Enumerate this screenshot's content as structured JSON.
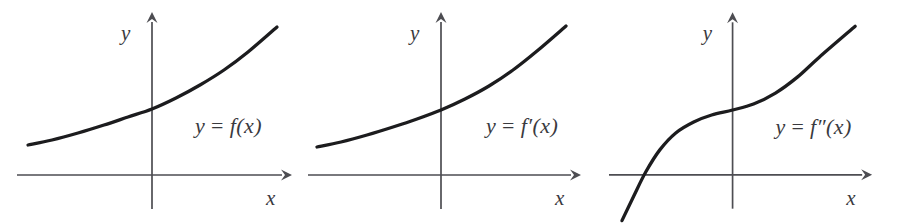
{
  "figure": {
    "background_color": "#ffffff",
    "axis_color": "#4d4d52",
    "curve_color": "#1c1c1e",
    "label_color": "#3a3a3e"
  },
  "panels": [
    {
      "id": "panel-1",
      "curve_label": "y = f(x)",
      "x_axis_label": "x",
      "y_axis_label": "y",
      "curve_description": "increasing convex exponential-like curve entirely above the x-axis"
    },
    {
      "id": "panel-2",
      "curve_label": "y = f′(x)",
      "x_axis_label": "x",
      "y_axis_label": "y",
      "curve_description": "increasing convex exponential-like curve entirely above the x-axis"
    },
    {
      "id": "panel-3",
      "curve_label": "y = f″(x)",
      "x_axis_label": "x",
      "y_axis_label": "y",
      "curve_description": "increasing cubic-like S curve with inflection at the origin, crossing the x-axis on the left"
    }
  ],
  "chart_data": [
    {
      "type": "line",
      "title": "y = f(x)",
      "xlabel": "x",
      "ylabel": "y",
      "grid": false,
      "legend": "none",
      "axes_origin_px": [
        152,
        175
      ],
      "xlim": [
        -2.7,
        2.9
      ],
      "ylim": [
        -0.45,
        3.6
      ],
      "series": [
        {
          "name": "f",
          "points_px": [
            [
              28,
              145
            ],
            [
              52,
              140
            ],
            [
              78,
              133
            ],
            [
              104,
              125
            ],
            [
              128,
              117
            ],
            [
              152,
              109
            ],
            [
              176,
              98
            ],
            [
              200,
              85
            ],
            [
              224,
              70
            ],
            [
              248,
              52
            ],
            [
              277,
              27
            ]
          ],
          "x": [
            -2.7,
            -2.16,
            -1.6,
            -1.04,
            -0.52,
            0,
            0.52,
            1.04,
            1.56,
            2.08,
            2.7
          ],
          "y": [
            0.65,
            0.75,
            0.9,
            1.08,
            1.26,
            1.43,
            1.67,
            1.96,
            2.29,
            2.7,
            3.25
          ]
        }
      ]
    },
    {
      "type": "line",
      "title": "y = f′(x)",
      "xlabel": "x",
      "ylabel": "y",
      "grid": false,
      "legend": "none",
      "axes_origin_px": [
        441,
        175
      ],
      "xlim": [
        -2.7,
        2.9
      ],
      "ylim": [
        -0.45,
        3.6
      ],
      "series": [
        {
          "name": "f-prime",
          "points_px": [
            [
              317,
              147
            ],
            [
              341,
              142
            ],
            [
              367,
              135
            ],
            [
              393,
              127
            ],
            [
              417,
              119
            ],
            [
              441,
              110
            ],
            [
              465,
              99
            ],
            [
              489,
              86
            ],
            [
              513,
              70
            ],
            [
              537,
              51
            ],
            [
              566,
              26
            ]
          ],
          "x": [
            -2.7,
            -2.16,
            -1.6,
            -1.04,
            -0.52,
            0,
            0.52,
            1.04,
            1.56,
            2.08,
            2.7
          ],
          "y": [
            0.6,
            0.72,
            0.87,
            1.04,
            1.22,
            1.41,
            1.65,
            1.93,
            2.29,
            2.7,
            3.25
          ]
        }
      ]
    },
    {
      "type": "line",
      "title": "y = f″(x)",
      "xlabel": "x",
      "ylabel": "y",
      "grid": false,
      "legend": "none",
      "axes_origin_px": [
        733,
        175
      ],
      "xlim": [
        -2.7,
        2.9
      ],
      "ylim": [
        -1.2,
        3.6
      ],
      "series": [
        {
          "name": "f-double-prime",
          "points_px": [
            [
              622,
              221
            ],
            [
              634,
              196
            ],
            [
              646,
              172
            ],
            [
              660,
              150
            ],
            [
              676,
              133
            ],
            [
              694,
              122
            ],
            [
              712,
              115
            ],
            [
              733,
              110
            ],
            [
              754,
              104
            ],
            [
              776,
              93
            ],
            [
              798,
              77
            ],
            [
              820,
              57
            ],
            [
              856,
              26
            ]
          ],
          "x": [
            -2.45,
            -2.2,
            -1.95,
            -1.6,
            -1.25,
            -0.85,
            -0.45,
            0,
            0.45,
            0.95,
            1.4,
            1.9,
            2.7
          ],
          "y": [
            -1.05,
            -0.47,
            0.07,
            0.57,
            0.95,
            1.21,
            1.37,
            1.45,
            1.58,
            1.83,
            2.18,
            2.63,
            3.35
          ]
        }
      ]
    }
  ]
}
